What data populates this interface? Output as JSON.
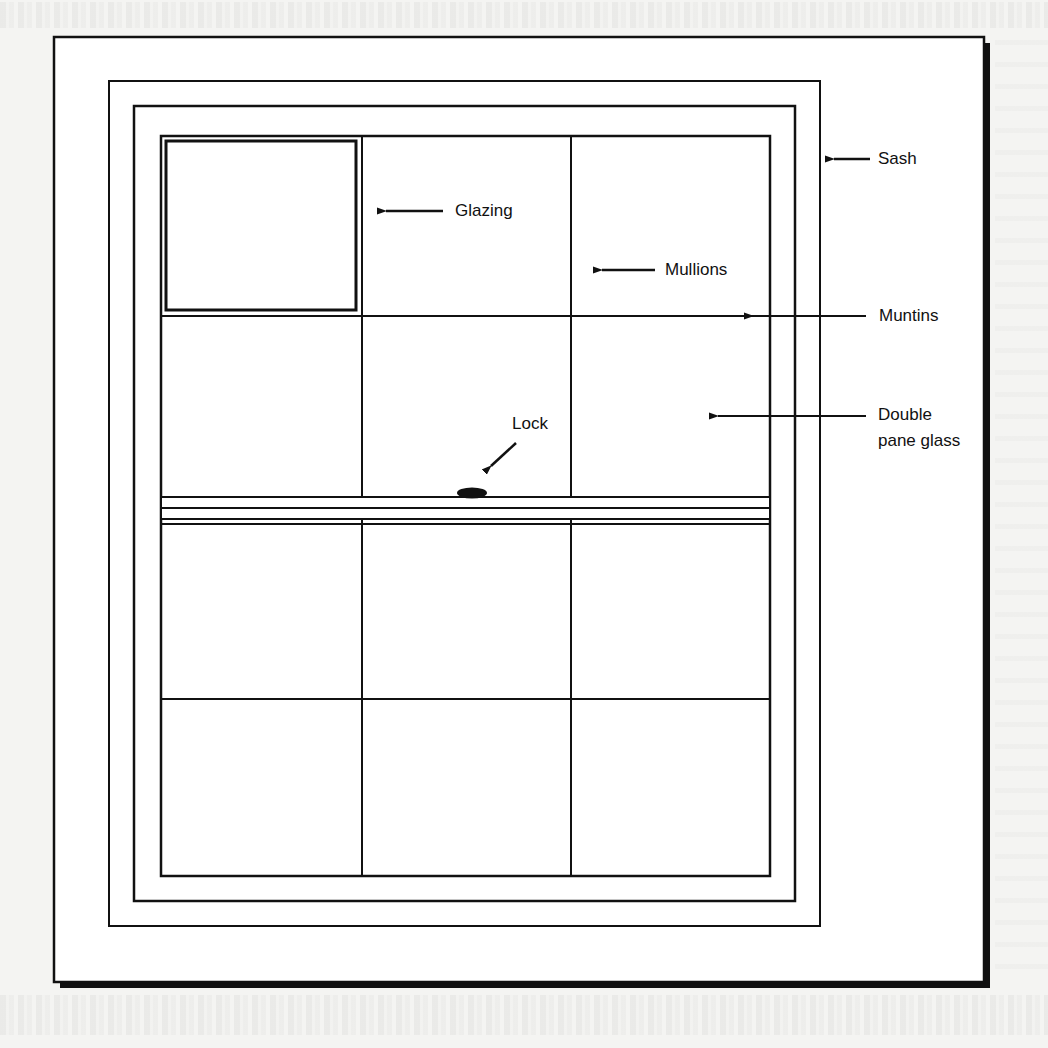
{
  "figure": {
    "type": "window diagram"
  },
  "labels": {
    "sash": "Sash",
    "glazing": "Glazing",
    "mullions": "Mullions",
    "muntins": "Muntins",
    "double_pane_line1": "Double",
    "double_pane_line2": "pane glass",
    "lock": "Lock"
  },
  "colors": {
    "ink": "#111111",
    "paper": "#ffffff",
    "background": "#f4f4f2"
  },
  "grid": {
    "columns": 3,
    "rows": 4
  }
}
